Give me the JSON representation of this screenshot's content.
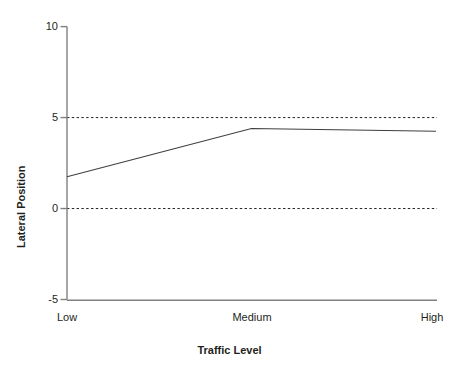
{
  "chart_data": {
    "type": "line",
    "title": "",
    "subtitle": "",
    "xlabel": "Traffic Level",
    "ylabel": "Lateral Position",
    "categories": [
      "Low",
      "Medium",
      "High"
    ],
    "values": [
      1.75,
      4.4,
      4.25
    ],
    "series": [
      {
        "name": "Lateral Position",
        "values": [
          1.75,
          4.4,
          4.25
        ],
        "color": "#3f3f3f"
      }
    ],
    "ylim": [
      -5,
      10
    ],
    "yticks": [
      10,
      5,
      0,
      -5
    ],
    "ytick_labels": [
      "10",
      "5",
      "0",
      "-5"
    ],
    "xtick_labels": [
      "Low",
      "Medium",
      "High"
    ],
    "grid": false,
    "reference_lines": [
      {
        "value": 5,
        "style": "dashed",
        "color": "#231f20"
      },
      {
        "value": 0,
        "style": "dashed",
        "color": "#231f20"
      }
    ],
    "legend": "none",
    "legend_position": "none",
    "background_color": "#ffffff",
    "axis_color": "#808080"
  },
  "axes": {
    "y_tick_0": "10",
    "y_tick_1": "5",
    "y_tick_2": "0",
    "y_tick_3": "-5",
    "x_tick_0": "Low",
    "x_tick_1": "Medium",
    "x_tick_2": "High",
    "x_title": "Traffic Level",
    "y_title": "Lateral Position"
  }
}
